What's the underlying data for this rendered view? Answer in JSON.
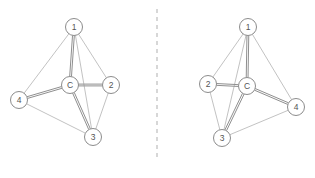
{
  "figure": {
    "title": "",
    "divider": {
      "name": "vertical-dashed-divider",
      "x": 157,
      "y1": 9,
      "y2": 160,
      "color": "#c2c2c2",
      "style": "dashed"
    },
    "colors": {
      "node_fill": "#ffffff",
      "node_stroke": "#8c8c8c",
      "label": "#555555",
      "edge_thin": "#b2b2b2",
      "edge_bold": "#8f8f8f",
      "background": "#ffffff"
    },
    "node_radius": 8.5,
    "panels": [
      {
        "id": "left-panel",
        "name": "left-graph-panel",
        "nodes": [
          {
            "id": "1",
            "label": "1",
            "x": 74,
            "y": 27
          },
          {
            "id": "2",
            "label": "2",
            "x": 111,
            "y": 85
          },
          {
            "id": "3",
            "label": "3",
            "x": 93,
            "y": 137
          },
          {
            "id": "4",
            "label": "4",
            "x": 19,
            "y": 100
          },
          {
            "id": "C",
            "label": "C",
            "x": 70,
            "y": 85
          }
        ],
        "edges": [
          {
            "from": "1",
            "to": "2",
            "weight": "thin"
          },
          {
            "from": "1",
            "to": "3",
            "weight": "thin"
          },
          {
            "from": "1",
            "to": "4",
            "weight": "thin"
          },
          {
            "from": "2",
            "to": "3",
            "weight": "thin"
          },
          {
            "from": "3",
            "to": "4",
            "weight": "thin"
          },
          {
            "from": "1",
            "to": "C",
            "weight": "bold"
          },
          {
            "from": "2",
            "to": "C",
            "weight": "bold"
          },
          {
            "from": "3",
            "to": "C",
            "weight": "bold"
          },
          {
            "from": "4",
            "to": "C",
            "weight": "bold"
          }
        ]
      },
      {
        "id": "right-panel",
        "name": "right-graph-panel",
        "nodes": [
          {
            "id": "1",
            "label": "1",
            "x": 248,
            "y": 27
          },
          {
            "id": "2",
            "label": "2",
            "x": 208,
            "y": 84
          },
          {
            "id": "3",
            "label": "3",
            "x": 222,
            "y": 138
          },
          {
            "id": "4",
            "label": "4",
            "x": 296,
            "y": 107
          },
          {
            "id": "C",
            "label": "C",
            "x": 247,
            "y": 86
          }
        ],
        "edges": [
          {
            "from": "1",
            "to": "2",
            "weight": "thin"
          },
          {
            "from": "1",
            "to": "3",
            "weight": "thin"
          },
          {
            "from": "1",
            "to": "4",
            "weight": "thin"
          },
          {
            "from": "2",
            "to": "3",
            "weight": "thin"
          },
          {
            "from": "3",
            "to": "4",
            "weight": "thin"
          },
          {
            "from": "1",
            "to": "C",
            "weight": "bold"
          },
          {
            "from": "2",
            "to": "C",
            "weight": "bold"
          },
          {
            "from": "3",
            "to": "C",
            "weight": "bold"
          },
          {
            "from": "4",
            "to": "C",
            "weight": "bold"
          }
        ]
      }
    ]
  }
}
